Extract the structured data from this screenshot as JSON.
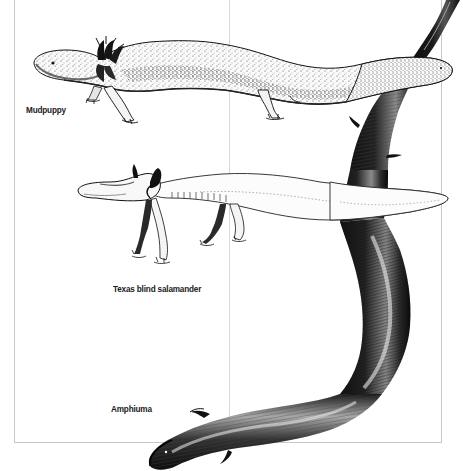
{
  "plate": {
    "background": "#ffffff",
    "frame_color": "#c8c8c8",
    "divider_color": "#d4d4d4",
    "ink_color": "#111111"
  },
  "specimens": [
    {
      "id": "mudpuppy",
      "label": "Mudpuppy"
    },
    {
      "id": "texas-blind-salamander",
      "label": "Texas blind salamander"
    },
    {
      "id": "amphiuma",
      "label": "Amphiuma"
    }
  ]
}
